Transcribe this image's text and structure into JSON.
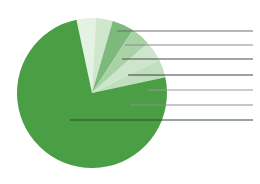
{
  "figure": {
    "name": "pie-chart-figure",
    "background": "#ffffff",
    "width": 260,
    "height": 184
  },
  "chart_data": {
    "type": "pie",
    "title": "",
    "subtitle": "",
    "xlabel": "",
    "ylabel": "",
    "grid": false,
    "legend": "none",
    "labels_shown": false,
    "start_angle_deg": -12,
    "direction": "clockwise",
    "center": {
      "x": 92,
      "y": 93
    },
    "radius": 75,
    "categories": [
      "Slice 1",
      "Slice 2",
      "Slice 3",
      "Slice 4",
      "Slice 5",
      "Slice 6",
      "Slice 7"
    ],
    "values": [
      4.2,
      3.6,
      4.7,
      4.2,
      4.4,
      3.9,
      75.0
    ],
    "colors": [
      "#e4f2e4",
      "#cfe7cd",
      "#7cb97a",
      "#a9d3a6",
      "#cde6cb",
      "#bfdfbd",
      "#4a9e44"
    ],
    "slice_angles_deg": [
      {
        "start": -12.0,
        "end": 3.1
      },
      {
        "start": 3.1,
        "end": 16.1
      },
      {
        "start": 16.1,
        "end": 33.0
      },
      {
        "start": 33.0,
        "end": 48.1
      },
      {
        "start": 48.1,
        "end": 63.9
      },
      {
        "start": 63.9,
        "end": 77.9
      },
      {
        "start": 77.9,
        "end": 348.0
      }
    ],
    "leader_lines": [
      {
        "name": "leader-line-1",
        "x1": 117,
        "y1": 31,
        "x2": 253,
        "y2": 31,
        "color": "#6e6e6e"
      },
      {
        "name": "leader-line-2",
        "x1": 125,
        "y1": 45,
        "x2": 253,
        "y2": 45,
        "color": "#8a8a8a"
      },
      {
        "name": "leader-line-3",
        "x1": 122,
        "y1": 59,
        "x2": 253,
        "y2": 59,
        "color": "#4a4a4a"
      },
      {
        "name": "leader-line-4",
        "x1": 128,
        "y1": 75,
        "x2": 253,
        "y2": 75,
        "color": "#3f3f3f"
      },
      {
        "name": "leader-line-5",
        "x1": 148,
        "y1": 90,
        "x2": 253,
        "y2": 90,
        "color": "#9a9a9a"
      },
      {
        "name": "leader-line-6",
        "x1": 130,
        "y1": 105,
        "x2": 253,
        "y2": 105,
        "color": "#8e8e8e"
      },
      {
        "name": "leader-line-7",
        "x1": 70,
        "y1": 120,
        "x2": 253,
        "y2": 120,
        "color": "#2e4a2c"
      }
    ]
  }
}
